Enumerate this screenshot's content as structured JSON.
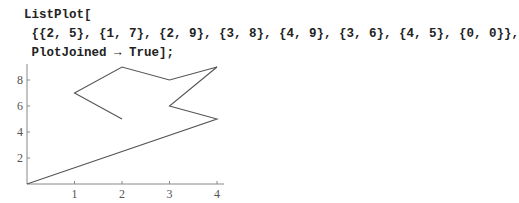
{
  "input_cell": {
    "lines": [
      "ListPlot[",
      " {{2, 5}, {1, 7}, {2, 9}, {3, 8}, {4, 9}, {3, 6}, {4, 5}, {0, 0}},",
      " PlotJoined → True];"
    ]
  },
  "chart_data": {
    "type": "line",
    "title": "",
    "xlabel": "",
    "ylabel": "",
    "points": [
      [
        2,
        5
      ],
      [
        1,
        7
      ],
      [
        2,
        9
      ],
      [
        3,
        8
      ],
      [
        4,
        9
      ],
      [
        3,
        6
      ],
      [
        4,
        5
      ],
      [
        0,
        0
      ]
    ],
    "x": [
      2,
      1,
      2,
      3,
      4,
      3,
      4,
      0
    ],
    "y": [
      5,
      7,
      9,
      8,
      9,
      6,
      5,
      0
    ],
    "x_ticks": [
      "1",
      "2",
      "3",
      "4"
    ],
    "y_ticks": [
      "2",
      "4",
      "6",
      "8"
    ],
    "xlim": [
      0,
      4.1
    ],
    "ylim": [
      0,
      9.2
    ],
    "grid": false,
    "legend": null,
    "line_color": "#555555",
    "joined": true
  }
}
